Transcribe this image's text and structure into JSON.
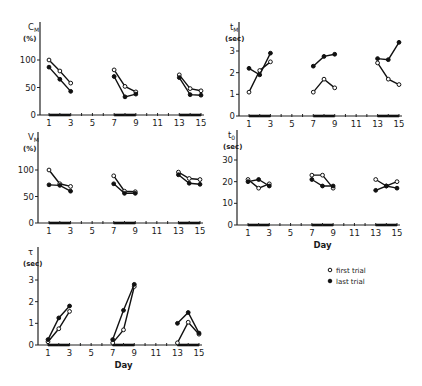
{
  "legend": {
    "open_label": "first trial",
    "filled_label": "last trial"
  },
  "chart_data": [
    {
      "type": "line",
      "id": "CM",
      "ylabel_main": "C",
      "ylabel_sub": "M",
      "ylabel_unit": "(%)",
      "xlabel": "",
      "ylim": [
        0,
        100
      ],
      "yticks": [
        0,
        50,
        100
      ],
      "xticks": [
        1,
        3,
        5,
        7,
        9,
        11,
        13,
        15
      ],
      "series": [
        {
          "name": "first trial",
          "marker": "open",
          "segments": [
            {
              "x": [
                1,
                2,
                3
              ],
              "y": [
                100,
                80,
                58
              ]
            },
            {
              "x": [
                7,
                8,
                9
              ],
              "y": [
                82,
                52,
                42
              ]
            },
            {
              "x": [
                13,
                14,
                15
              ],
              "y": [
                73,
                48,
                44
              ]
            }
          ]
        },
        {
          "name": "last trial",
          "marker": "filled",
          "segments": [
            {
              "x": [
                1,
                2,
                3
              ],
              "y": [
                87,
                65,
                43
              ]
            },
            {
              "x": [
                7,
                8,
                9
              ],
              "y": [
                70,
                33,
                38
              ]
            },
            {
              "x": [
                13,
                14,
                15
              ],
              "y": [
                68,
                37,
                36
              ]
            }
          ]
        }
      ]
    },
    {
      "type": "line",
      "id": "tM",
      "ylabel_main": "t",
      "ylabel_sub": "M",
      "ylabel_unit": "(sec)",
      "xlabel": "",
      "ylim": [
        0,
        3
      ],
      "yticks": [
        0,
        1,
        2,
        3
      ],
      "xticks": [
        1,
        3,
        5,
        7,
        9,
        11,
        13,
        15
      ],
      "series": [
        {
          "name": "first trial",
          "marker": "open",
          "segments": [
            {
              "x": [
                1,
                2,
                3
              ],
              "y": [
                1.1,
                2.1,
                2.5
              ]
            },
            {
              "x": [
                7,
                8,
                9
              ],
              "y": [
                1.1,
                1.7,
                1.3
              ]
            },
            {
              "x": [
                13,
                14,
                15
              ],
              "y": [
                2.45,
                1.7,
                1.45
              ]
            }
          ]
        },
        {
          "name": "last trial",
          "marker": "filled",
          "segments": [
            {
              "x": [
                1,
                2,
                3
              ],
              "y": [
                2.2,
                1.9,
                2.9
              ]
            },
            {
              "x": [
                7,
                8,
                9
              ],
              "y": [
                2.3,
                2.75,
                2.85
              ]
            },
            {
              "x": [
                13,
                14,
                15
              ],
              "y": [
                2.65,
                2.6,
                3.4
              ]
            }
          ]
        }
      ]
    },
    {
      "type": "line",
      "id": "VM",
      "ylabel_main": "V",
      "ylabel_sub": "M",
      "ylabel_unit": "(%)",
      "xlabel": "",
      "ylim": [
        0,
        100
      ],
      "yticks": [
        0,
        50,
        100
      ],
      "xticks": [
        1,
        3,
        5,
        7,
        9,
        11,
        13,
        15
      ],
      "series": [
        {
          "name": "first trial",
          "marker": "open",
          "segments": [
            {
              "x": [
                1,
                2,
                3
              ],
              "y": [
                100,
                74,
                69
              ]
            },
            {
              "x": [
                7,
                8,
                9
              ],
              "y": [
                89,
                60,
                59
              ]
            },
            {
              "x": [
                13,
                14,
                15
              ],
              "y": [
                96,
                84,
                82
              ]
            }
          ]
        },
        {
          "name": "last trial",
          "marker": "filled",
          "segments": [
            {
              "x": [
                1,
                2,
                3
              ],
              "y": [
                72,
                71,
                60
              ]
            },
            {
              "x": [
                7,
                8,
                9
              ],
              "y": [
                74,
                56,
                56
              ]
            },
            {
              "x": [
                13,
                14,
                15
              ],
              "y": [
                91,
                75,
                73
              ]
            }
          ]
        }
      ]
    },
    {
      "type": "line",
      "id": "to",
      "ylabel_main": "t",
      "ylabel_sub": "0",
      "ylabel_unit": "(sec)",
      "xlabel": "Day",
      "ylim": [
        0,
        30
      ],
      "yticks": [
        0,
        10,
        20,
        30
      ],
      "xticks": [
        1,
        3,
        5,
        7,
        9,
        11,
        13,
        15
      ],
      "series": [
        {
          "name": "first trial",
          "marker": "open",
          "segments": [
            {
              "x": [
                1,
                2,
                3
              ],
              "y": [
                21,
                17,
                19
              ]
            },
            {
              "x": [
                7,
                8,
                9
              ],
              "y": [
                23,
                23,
                17
              ]
            },
            {
              "x": [
                13,
                14,
                15
              ],
              "y": [
                21,
                18,
                20
              ]
            }
          ]
        },
        {
          "name": "last trial",
          "marker": "filled",
          "segments": [
            {
              "x": [
                1,
                2,
                3
              ],
              "y": [
                20,
                21,
                18
              ]
            },
            {
              "x": [
                7,
                8,
                9
              ],
              "y": [
                21,
                18,
                18
              ]
            },
            {
              "x": [
                13,
                14,
                15
              ],
              "y": [
                16,
                18,
                17
              ]
            }
          ]
        }
      ]
    },
    {
      "type": "line",
      "id": "tau",
      "ylabel_main": "τ",
      "ylabel_sub": "",
      "ylabel_unit": "(sec)",
      "xlabel": "Day",
      "ylim": [
        0,
        3
      ],
      "yticks": [
        0,
        1,
        2,
        3
      ],
      "xticks": [
        1,
        3,
        5,
        7,
        9,
        11,
        13,
        15
      ],
      "series": [
        {
          "name": "first trial",
          "marker": "open",
          "segments": [
            {
              "x": [
                1,
                2,
                3
              ],
              "y": [
                0.15,
                0.75,
                1.55
              ]
            },
            {
              "x": [
                7,
                8,
                9
              ],
              "y": [
                0.1,
                0.7,
                2.7
              ]
            },
            {
              "x": [
                13,
                14,
                15
              ],
              "y": [
                0.1,
                1.05,
                0.5
              ]
            }
          ]
        },
        {
          "name": "last trial",
          "marker": "filled",
          "segments": [
            {
              "x": [
                1,
                2,
                3
              ],
              "y": [
                0.25,
                1.25,
                1.8
              ]
            },
            {
              "x": [
                7,
                8,
                9
              ],
              "y": [
                0.25,
                1.6,
                2.8
              ]
            },
            {
              "x": [
                13,
                14,
                15
              ],
              "y": [
                1.0,
                1.5,
                0.55
              ]
            }
          ]
        }
      ]
    }
  ]
}
